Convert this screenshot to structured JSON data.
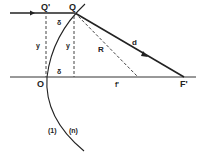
{
  "diagram": {
    "type": "refraction-spherical-surface",
    "labels": {
      "Q_prime": "Q'",
      "Q": "Q",
      "O": "O",
      "F_prime": "F'",
      "delta_top": "δ",
      "delta_bottom": "δ",
      "y_left": "y",
      "y_right": "y",
      "R": "R",
      "d": "d",
      "f_prime": "f'",
      "medium_1": "(1)",
      "medium_n": "(n)"
    },
    "colors": {
      "ink": "#222222",
      "background": "#ffffff"
    }
  }
}
